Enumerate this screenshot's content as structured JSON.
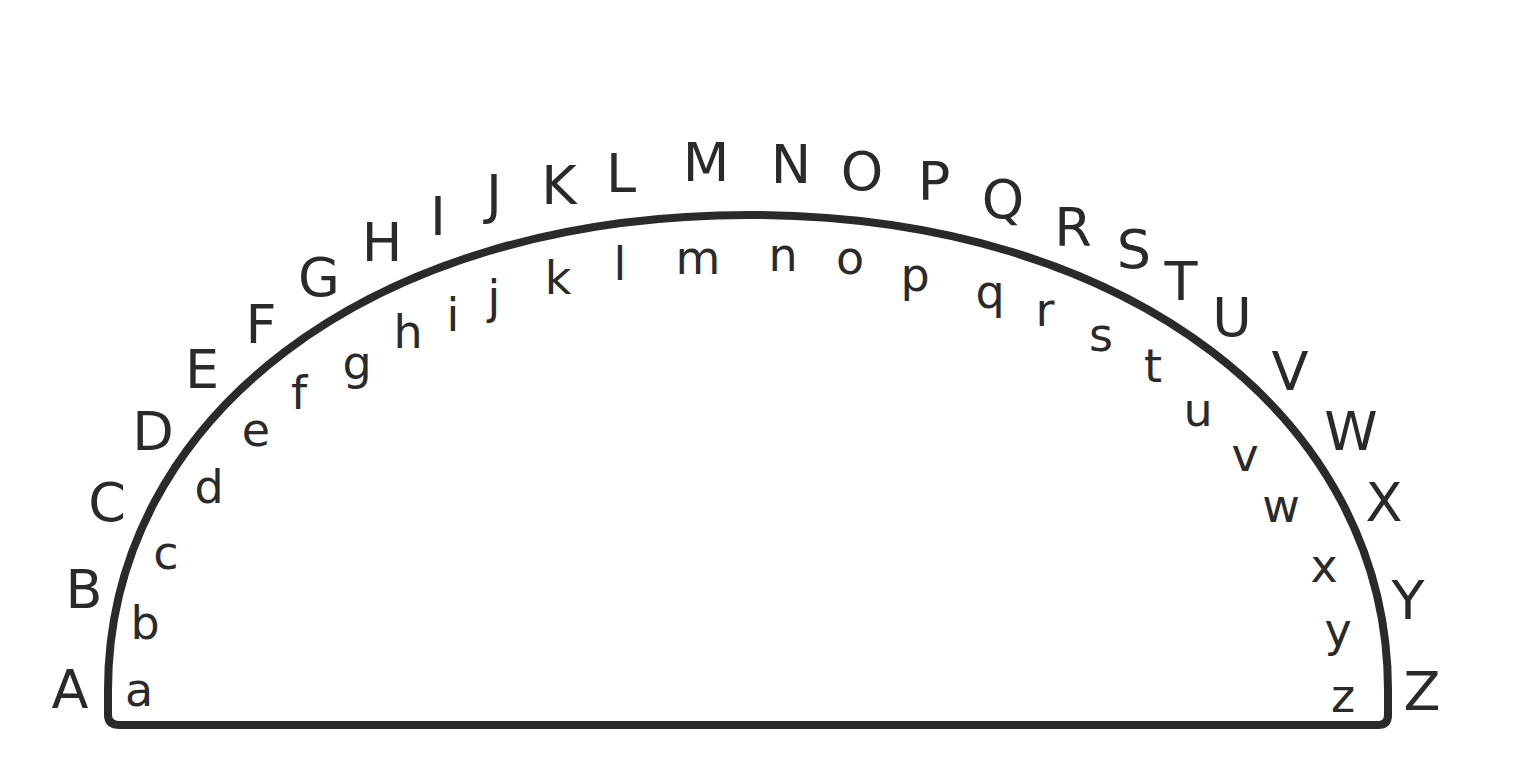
{
  "diagram": {
    "title": "",
    "stroke_color": "#2a2a2a",
    "text_color": "#2a2a2a",
    "background": "#ffffff",
    "uppercase": [
      {
        "ch": "A",
        "x": 70,
        "y": 690
      },
      {
        "ch": "B",
        "x": 84,
        "y": 590
      },
      {
        "ch": "C",
        "x": 107,
        "y": 503
      },
      {
        "ch": "D",
        "x": 153,
        "y": 432
      },
      {
        "ch": "E",
        "x": 202,
        "y": 370
      },
      {
        "ch": "F",
        "x": 261,
        "y": 325
      },
      {
        "ch": "G",
        "x": 319,
        "y": 278
      },
      {
        "ch": "H",
        "x": 382,
        "y": 243
      },
      {
        "ch": "I",
        "x": 438,
        "y": 217
      },
      {
        "ch": "J",
        "x": 494,
        "y": 195
      },
      {
        "ch": "K",
        "x": 559,
        "y": 186
      },
      {
        "ch": "L",
        "x": 621,
        "y": 174
      },
      {
        "ch": "M",
        "x": 706,
        "y": 163
      },
      {
        "ch": "N",
        "x": 791,
        "y": 165
      },
      {
        "ch": "O",
        "x": 862,
        "y": 172
      },
      {
        "ch": "P",
        "x": 934,
        "y": 182
      },
      {
        "ch": "Q",
        "x": 1003,
        "y": 200
      },
      {
        "ch": "R",
        "x": 1073,
        "y": 228
      },
      {
        "ch": "S",
        "x": 1134,
        "y": 250
      },
      {
        "ch": "T",
        "x": 1181,
        "y": 282
      },
      {
        "ch": "U",
        "x": 1232,
        "y": 318
      },
      {
        "ch": "V",
        "x": 1290,
        "y": 372
      },
      {
        "ch": "W",
        "x": 1351,
        "y": 432
      },
      {
        "ch": "X",
        "x": 1384,
        "y": 503
      },
      {
        "ch": "Y",
        "x": 1408,
        "y": 601
      },
      {
        "ch": "Z",
        "x": 1422,
        "y": 692
      }
    ],
    "lowercase": [
      {
        "ch": "a",
        "x": 139,
        "y": 690
      },
      {
        "ch": "b",
        "x": 145,
        "y": 623
      },
      {
        "ch": "c",
        "x": 166,
        "y": 553
      },
      {
        "ch": "d",
        "x": 209,
        "y": 487
      },
      {
        "ch": "e",
        "x": 256,
        "y": 430
      },
      {
        "ch": "f",
        "x": 299,
        "y": 393
      },
      {
        "ch": "g",
        "x": 357,
        "y": 363
      },
      {
        "ch": "h",
        "x": 408,
        "y": 332
      },
      {
        "ch": "i",
        "x": 453,
        "y": 315
      },
      {
        "ch": "j",
        "x": 494,
        "y": 297
      },
      {
        "ch": "k",
        "x": 558,
        "y": 278
      },
      {
        "ch": "l",
        "x": 620,
        "y": 264
      },
      {
        "ch": "m",
        "x": 698,
        "y": 258
      },
      {
        "ch": "n",
        "x": 783,
        "y": 255
      },
      {
        "ch": "o",
        "x": 850,
        "y": 258
      },
      {
        "ch": "p",
        "x": 915,
        "y": 275
      },
      {
        "ch": "q",
        "x": 990,
        "y": 292
      },
      {
        "ch": "r",
        "x": 1045,
        "y": 310
      },
      {
        "ch": "s",
        "x": 1101,
        "y": 335
      },
      {
        "ch": "t",
        "x": 1153,
        "y": 366
      },
      {
        "ch": "u",
        "x": 1198,
        "y": 410
      },
      {
        "ch": "v",
        "x": 1245,
        "y": 455
      },
      {
        "ch": "w",
        "x": 1281,
        "y": 506
      },
      {
        "ch": "x",
        "x": 1324,
        "y": 566
      },
      {
        "ch": "y",
        "x": 1338,
        "y": 630
      },
      {
        "ch": "z",
        "x": 1343,
        "y": 696
      }
    ]
  }
}
